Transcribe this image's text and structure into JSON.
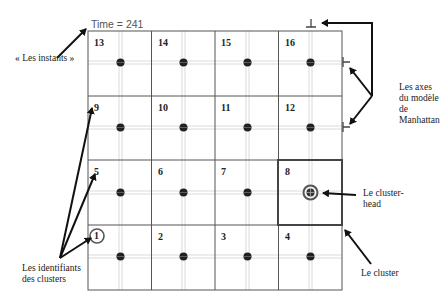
{
  "time_label": "Time = 241",
  "annotations": {
    "instants": "« Les instants »",
    "axes": [
      "Les axes",
      "du modèle",
      "de",
      "Manhattan"
    ],
    "cluster_head": [
      "Le cluster-",
      "head"
    ],
    "cluster": "Le cluster",
    "identifiers": [
      "Les identifiants",
      "des clusters"
    ]
  },
  "grid": {
    "rows": [
      [
        "13",
        "14",
        "15",
        "16"
      ],
      [
        "9",
        "10",
        "11",
        "12"
      ],
      [
        "5",
        "6",
        "7",
        "8"
      ],
      [
        "1",
        "2",
        "3",
        "4"
      ]
    ],
    "highlighted_cluster": "8",
    "circled_identifier": "1"
  },
  "colors": {
    "grid_line": "#444444",
    "axis_line": "#d6d6d6",
    "node": "#222222",
    "arrow": "#111111"
  }
}
